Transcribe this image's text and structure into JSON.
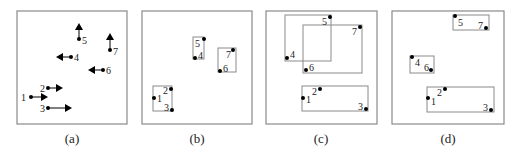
{
  "figure": {
    "panels": [
      {
        "id": "a",
        "caption": "(a)",
        "frame": {
          "x": 17,
          "y": 11,
          "w": 110,
          "h": 113
        },
        "caption_pos": {
          "x": 72,
          "y": 143
        },
        "points": [
          {
            "label": "1",
            "x": 31,
            "y": 97,
            "arrow": {
              "dir": "right",
              "tx": 48,
              "ty": 97
            },
            "lx": 21,
            "ly": 101
          },
          {
            "label": "2",
            "x": 48,
            "y": 88,
            "arrow": {
              "dir": "right",
              "tx": 63,
              "ty": 88
            },
            "lx": 40,
            "ly": 92
          },
          {
            "label": "3",
            "x": 48,
            "y": 108,
            "arrow": {
              "dir": "right",
              "tx": 72,
              "ty": 108
            },
            "lx": 40,
            "ly": 112
          },
          {
            "label": "4",
            "x": 71,
            "y": 57,
            "arrow": {
              "dir": "left",
              "tx": 56,
              "ty": 57
            },
            "lx": 74,
            "ly": 61
          },
          {
            "label": "5",
            "x": 79,
            "y": 39,
            "arrow": {
              "dir": "up",
              "tx": 79,
              "ty": 23
            },
            "lx": 82,
            "ly": 44
          },
          {
            "label": "6",
            "x": 103,
            "y": 70,
            "arrow": {
              "dir": "left",
              "tx": 88,
              "ty": 70
            },
            "lx": 106,
            "ly": 74
          },
          {
            "label": "7",
            "x": 110,
            "y": 50,
            "arrow": {
              "dir": "up",
              "tx": 110,
              "ty": 33
            },
            "lx": 113,
            "ly": 55
          }
        ],
        "boxes": []
      },
      {
        "id": "b",
        "caption": "(b)",
        "frame": {
          "x": 142,
          "y": 11,
          "w": 110,
          "h": 113
        },
        "caption_pos": {
          "x": 197,
          "y": 143
        },
        "boxes": [
          {
            "x": 193,
            "y": 37,
            "w": 11,
            "h": 22
          },
          {
            "x": 218,
            "y": 48,
            "w": 18,
            "h": 24
          },
          {
            "x": 153,
            "y": 86,
            "w": 19,
            "h": 25
          }
        ],
        "points": [
          {
            "label": "1",
            "x": 154,
            "y": 98,
            "lx": 157,
            "ly": 102
          },
          {
            "label": "2",
            "x": 171,
            "y": 89,
            "lx": 163,
            "ly": 94
          },
          {
            "label": "3",
            "x": 172,
            "y": 110,
            "lx": 164,
            "ly": 111
          },
          {
            "label": "4",
            "x": 195,
            "y": 58,
            "lx": 198,
            "ly": 59
          },
          {
            "label": "5",
            "x": 204,
            "y": 39,
            "lx": 195,
            "ly": 47
          },
          {
            "label": "6",
            "x": 220,
            "y": 71,
            "lx": 223,
            "ly": 72
          },
          {
            "label": "7",
            "x": 233,
            "y": 50,
            "lx": 226,
            "ly": 58
          }
        ]
      },
      {
        "id": "c",
        "caption": "(c)",
        "frame": {
          "x": 266,
          "y": 11,
          "w": 111,
          "h": 113
        },
        "caption_pos": {
          "x": 321,
          "y": 143
        },
        "boxes": [
          {
            "x": 285,
            "y": 15,
            "w": 46,
            "h": 46
          },
          {
            "x": 303,
            "y": 25,
            "w": 59,
            "h": 48
          },
          {
            "x": 302,
            "y": 86,
            "w": 66,
            "h": 25
          }
        ],
        "points": [
          {
            "label": "1",
            "x": 303,
            "y": 98,
            "lx": 306,
            "ly": 103
          },
          {
            "label": "2",
            "x": 320,
            "y": 89,
            "lx": 312,
            "ly": 95
          },
          {
            "label": "3",
            "x": 366,
            "y": 109,
            "lx": 358,
            "ly": 110
          },
          {
            "label": "4",
            "x": 287,
            "y": 58,
            "lx": 290,
            "ly": 58
          },
          {
            "label": "5",
            "x": 330,
            "y": 17,
            "lx": 322,
            "ly": 25
          },
          {
            "label": "6",
            "x": 306,
            "y": 70,
            "lx": 309,
            "ly": 71
          },
          {
            "label": "7",
            "x": 360,
            "y": 27,
            "lx": 352,
            "ly": 35
          }
        ]
      },
      {
        "id": "d",
        "caption": "(d)",
        "frame": {
          "x": 392,
          "y": 11,
          "w": 112,
          "h": 113
        },
        "caption_pos": {
          "x": 448,
          "y": 143
        },
        "boxes": [
          {
            "x": 453,
            "y": 15,
            "w": 36,
            "h": 15
          },
          {
            "x": 410,
            "y": 56,
            "w": 24,
            "h": 17
          },
          {
            "x": 427,
            "y": 87,
            "w": 67,
            "h": 25
          }
        ],
        "points": [
          {
            "label": "1",
            "x": 428,
            "y": 98,
            "lx": 431,
            "ly": 105
          },
          {
            "label": "2",
            "x": 445,
            "y": 89,
            "lx": 437,
            "ly": 96
          },
          {
            "label": "3",
            "x": 491,
            "y": 110,
            "lx": 483,
            "ly": 111
          },
          {
            "label": "4",
            "x": 412,
            "y": 57,
            "lx": 415,
            "ly": 66
          },
          {
            "label": "5",
            "x": 455,
            "y": 16,
            "lx": 458,
            "ly": 26
          },
          {
            "label": "6",
            "x": 431,
            "y": 70,
            "lx": 424,
            "ly": 71
          },
          {
            "label": "7",
            "x": 486,
            "y": 28,
            "lx": 478,
            "ly": 29
          }
        ]
      }
    ]
  }
}
